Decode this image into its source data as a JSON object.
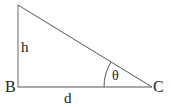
{
  "diagram": {
    "type": "right-triangle",
    "colors": {
      "line": "#555555",
      "text": "#222222",
      "background": "#ffffff"
    },
    "vertices": {
      "B": {
        "label": "B"
      },
      "C": {
        "label": "C"
      }
    },
    "sides": {
      "vertical": {
        "label": "h"
      },
      "horizontal": {
        "label": "d"
      }
    },
    "angle": {
      "label": "θ",
      "at_vertex": "C"
    }
  }
}
